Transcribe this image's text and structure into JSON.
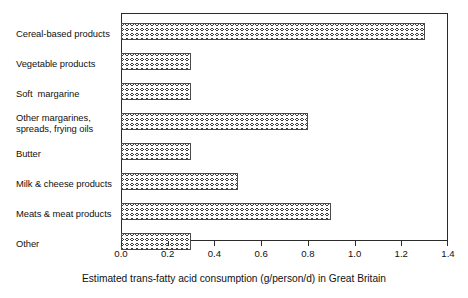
{
  "chart_data": {
    "type": "bar",
    "orientation": "horizontal",
    "title": "",
    "subtitle": "",
    "xlabel": "Estimated trans-fatty acid consumption (g/person/d) in Great Britain",
    "ylabel": "",
    "categories": [
      "Cereal-based products",
      "Vegetable products",
      "Soft  margarine",
      "Other margarines,\nspreads, frying oils",
      "Butter",
      "Milk & cheese products",
      "Meats & meat products",
      "Other"
    ],
    "values": [
      1.3,
      0.3,
      0.3,
      0.8,
      0.3,
      0.5,
      0.9,
      0.3
    ],
    "xlim": [
      0.0,
      1.4
    ],
    "xticks": [
      0.0,
      0.2,
      0.4,
      0.6,
      0.8,
      1.0,
      1.2,
      1.4
    ],
    "xtick_labels": [
      "0.0",
      "0.2",
      "0.4",
      "0.6",
      "0.8",
      "1.0",
      "1.2",
      "1.4"
    ],
    "grid": false,
    "legend": null,
    "legend_position": "none",
    "bar_fill": "crosshatch",
    "bar_edge_color": "#4a4a4a",
    "axis_color": "#2b2b2b",
    "background_color": "#ffffff",
    "text_color": "#111111"
  }
}
